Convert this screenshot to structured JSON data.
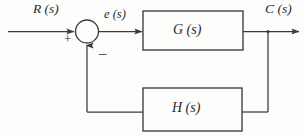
{
  "diagram": {
    "type": "block-diagram",
    "signals": {
      "input": "R (s)",
      "error": "e (s)",
      "output": "C (s)"
    },
    "blocks": [
      {
        "id": "forward-path",
        "label": "G (s)"
      },
      {
        "id": "feedback-path",
        "label": "H (s)"
      }
    ],
    "summing_junction": {
      "input_sign": "+",
      "feedback_sign": "–"
    },
    "colors": {
      "line": "#3a3a3a",
      "text": "#2a2a2a",
      "background": "#fdfdfc"
    }
  }
}
